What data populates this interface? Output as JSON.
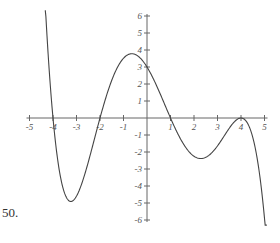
{
  "problem_number": "50.",
  "chart_data": {
    "type": "line",
    "title": "",
    "xlabel": "",
    "ylabel": "",
    "xlim": [
      -5,
      5
    ],
    "ylim": [
      -6,
      6
    ],
    "x_ticks": [
      -5,
      -4,
      -3,
      -2,
      -1,
      1,
      2,
      3,
      4,
      5
    ],
    "y_ticks": [
      -6,
      -5,
      -4,
      -3,
      -2,
      -1,
      1,
      2,
      3,
      4,
      5,
      6
    ],
    "grid": false,
    "series": [
      {
        "name": "f(x)",
        "description": "polynomial with zeros at -4, -2, 1 and double root at 4; y-intercept 3",
        "x_range": [
          -4.35,
          5.1
        ],
        "key_points": [
          {
            "x": -4,
            "y": 0
          },
          {
            "x": -3.3,
            "y": -4.9
          },
          {
            "x": -2,
            "y": 0
          },
          {
            "x": -0.6,
            "y": 3.8
          },
          {
            "x": 0,
            "y": 3
          },
          {
            "x": 1,
            "y": 0
          },
          {
            "x": 2.3,
            "y": -2.4
          },
          {
            "x": 4,
            "y": 0
          },
          {
            "x": 5.1,
            "y": -6
          }
        ]
      }
    ]
  }
}
